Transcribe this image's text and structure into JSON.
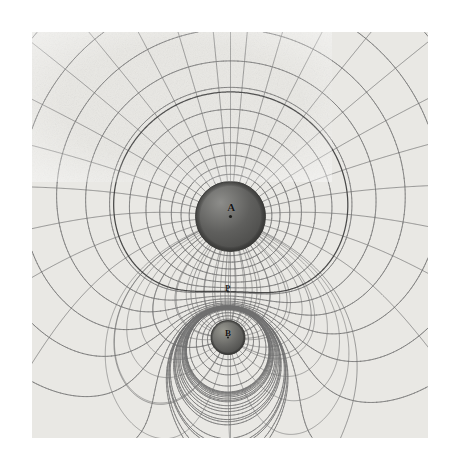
{
  "figure": {
    "kind": "field-map",
    "caption_visible": false,
    "plate": {
      "x": 32,
      "y": 32,
      "width": 396,
      "height": 406,
      "background_color": "#e9e8e4",
      "line_color": "#6f6f6f",
      "dashed_color": "#3b3b3b"
    },
    "labels": [
      {
        "name": "sphere-a-label",
        "text": "A",
        "x": 231,
        "y": 208,
        "size": 11
      },
      {
        "name": "sphere-b-label",
        "text": "B",
        "x": 228,
        "y": 334,
        "size": 9
      },
      {
        "name": "point-p-label",
        "text": "P",
        "x": 228,
        "y": 289,
        "size": 8
      }
    ]
  },
  "chart_data": {
    "type": "scatter",
    "title": "",
    "subtitle": "",
    "xlabel": "",
    "ylabel": "",
    "grid": true,
    "legend": "none",
    "xlim": [
      32,
      428
    ],
    "ylim": [
      32,
      438
    ],
    "charges": [
      {
        "label": "A",
        "cx": 230.5,
        "cy": 216.5,
        "radius": 35.0,
        "q": 1.0,
        "fill_dark": "#5f5f5d",
        "fill_light": "#8d8d8a"
      },
      {
        "label": "B",
        "cx": 228.0,
        "cy": 337.5,
        "radius": 17.0,
        "q": -0.3,
        "fill_dark": "#6a6a67",
        "fill_light": "#97978f"
      }
    ],
    "neutral_point": {
      "label": "P",
      "x": 228.0,
      "y": 291.5
    },
    "equipotentials": {
      "count": 26,
      "style": "solid",
      "note": "near-circular about each charge, distorted toward the saddle"
    },
    "field_lines": {
      "count": 36,
      "style": "solid",
      "note": "radial from A, converging on B or escaping to infinity"
    },
    "separatrix": {
      "style": "dashed",
      "note": "critical field line through the neutral point P"
    },
    "axis_line": {
      "style": "solid",
      "note": "vertical symmetry axis through A, P and B"
    }
  }
}
